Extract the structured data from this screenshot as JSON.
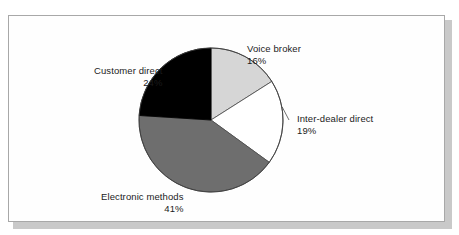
{
  "figure": {
    "background_color": "#ffffff",
    "frame_border_color": "#a8a8a8",
    "shadow_color": "#c9c9c9"
  },
  "chart_data": {
    "type": "pie",
    "title": "",
    "subtitle": "",
    "xlabel": "",
    "ylabel": "",
    "legend_position": "none",
    "grid": false,
    "label_format": "name + percent",
    "start_angle_deg": 0,
    "direction": "clockwise",
    "categories": [
      "Voice broker",
      "Inter-dealer direct",
      "Electronic methods",
      "Customer direct"
    ],
    "values": [
      16,
      19,
      41,
      24
    ],
    "value_labels": [
      "16%",
      "19%",
      "41%",
      "24%"
    ],
    "unit": "%",
    "total": 100,
    "colors": [
      "#d6d6d6",
      "#ffffff",
      "#6e6e6e",
      "#000000"
    ],
    "slices": [
      {
        "name": "Voice broker",
        "value": 16,
        "value_label": "16%",
        "color": "#d6d6d6",
        "start_deg": 0,
        "end_deg": 57.6,
        "has_leader_line": false
      },
      {
        "name": "Inter-dealer direct",
        "value": 19,
        "value_label": "19%",
        "color": "#ffffff",
        "start_deg": 57.6,
        "end_deg": 126.0,
        "has_leader_line": true
      },
      {
        "name": "Electronic methods",
        "value": 41,
        "value_label": "41%",
        "color": "#6e6e6e",
        "start_deg": 126.0,
        "end_deg": 273.6,
        "has_leader_line": false
      },
      {
        "name": "Customer direct",
        "value": 24,
        "value_label": "24%",
        "color": "#000000",
        "start_deg": 273.6,
        "end_deg": 360.0,
        "has_leader_line": false
      }
    ]
  },
  "labels": {
    "voice_broker": {
      "name": "Voice broker",
      "percent": "16%"
    },
    "inter_dealer": {
      "name": "Inter-dealer direct",
      "percent": "19%"
    },
    "electronic": {
      "name": "Electronic methods",
      "percent": "41%"
    },
    "customer_direct": {
      "name": "Customer direct",
      "percent": "24%"
    }
  }
}
